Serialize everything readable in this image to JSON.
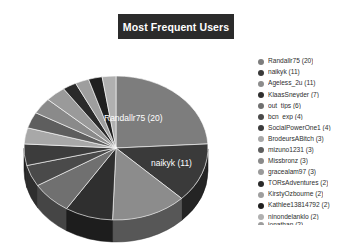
{
  "chart_data": {
    "type": "pie",
    "title": "Most Frequent Users",
    "xlabel": "",
    "ylabel": "",
    "legend_position": "right",
    "grid": false,
    "three_d": true,
    "categories": [
      "Randallr75",
      "naikyk",
      "Ageless_2u",
      "KlaasSneyder",
      "out_tips",
      "bcn_exp",
      "SocialPowerOne1",
      "BrodeursABitch",
      "mizuno1231",
      "Missbronz",
      "gracealam97",
      "TORsAdventures",
      "KirstyOzbourne",
      "Kathlee13814792",
      "ninondelanklo"
    ],
    "values": [
      20,
      11,
      11,
      7,
      6,
      4,
      4,
      3,
      3,
      3,
      3,
      2,
      2,
      2,
      2
    ],
    "colors": [
      "#7d7d7d",
      "#3a3a3a",
      "#8c8c8c",
      "#2f2f2f",
      "#707070",
      "#4a4a4a",
      "#3c3c3c",
      "#a8a8a8",
      "#5e5e5e",
      "#8a8a8a",
      "#9a9a9a",
      "#2a2a2a",
      "#9e9e9e",
      "#1f1f1f",
      "#b0b0b0"
    ],
    "slice_labels": [
      {
        "text": "Randallr75 (20)",
        "x": 88,
        "y": 59
      },
      {
        "text": "naikyk (11)",
        "x": 135,
        "y": 104
      }
    ]
  },
  "title_bar": {
    "label": "Most Frequent Users"
  },
  "legend": {
    "items": [
      {
        "label": "Randallr75 (20)",
        "color": "#7d7d7d"
      },
      {
        "label": "naikyk (11)",
        "color": "#3a3a3a"
      },
      {
        "label": "Ageless_2u (11)",
        "color": "#8c8c8c"
      },
      {
        "label": "KlaasSneyder (7)",
        "color": "#2f2f2f"
      },
      {
        "label": "out_tips (6)",
        "color": "#707070"
      },
      {
        "label": "bcn_exp (4)",
        "color": "#4a4a4a"
      },
      {
        "label": "SocialPowerOne1 (4)",
        "color": "#3c3c3c"
      },
      {
        "label": "BrodeursABitch (3)",
        "color": "#a8a8a8"
      },
      {
        "label": "mizuno1231 (3)",
        "color": "#5e5e5e"
      },
      {
        "label": "Missbronz (3)",
        "color": "#8a8a8a"
      },
      {
        "label": "gracealam97 (3)",
        "color": "#9a9a9a"
      },
      {
        "label": "TORsAdventures (2)",
        "color": "#2a2a2a"
      },
      {
        "label": "KirstyOzbourne (2)",
        "color": "#9e9e9e"
      },
      {
        "label": "Kathlee13814792 (2)",
        "color": "#1f1f1f"
      },
      {
        "label": "ninondelanklo (2)",
        "color": "#b0b0b0"
      }
    ],
    "clipped_item": {
      "label": "jonathan (2)",
      "color": "#9d9d9d"
    }
  }
}
